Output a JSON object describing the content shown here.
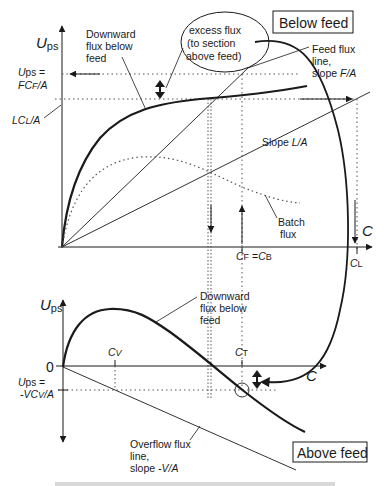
{
  "figure": {
    "type": "flux-curve-diagram",
    "top_panel": {
      "box_label": "Below feed",
      "y_axis_label_main": "U",
      "y_axis_label_sub": "ps",
      "x_axis_label": "C",
      "ups_label_line1": "U",
      "ups_label_line1_sub": "ps",
      "ups_label_line1_eq": " =",
      "ups_label_line2": "FC",
      "ups_label_line2_sub": "F",
      "ups_label_line2_tail": "/A",
      "lcl_label_main": "LC",
      "lcl_label_sub": "L",
      "lcl_label_tail": "/A",
      "downward_flux_label": [
        "Downward",
        "flux below",
        "feed"
      ],
      "excess_flux_label": [
        "excess flux",
        "(to section",
        "above feed)"
      ],
      "feed_flux_label": [
        "Feed flux",
        "line,",
        "slope "
      ],
      "feed_flux_slope": "F/A",
      "slope_l_label": "Slope ",
      "slope_l_value": "L/A",
      "batch_flux_label": [
        "Batch",
        "flux"
      ],
      "cf_label_a": "C",
      "cf_label_a_sub": "F",
      "cf_label_eq": " =",
      "cf_label_b": "C",
      "cf_label_b_sub": "B",
      "cl_label": "C",
      "cl_label_sub": "L"
    },
    "bottom_panel": {
      "box_label": "Above feed",
      "y_axis_label_main": "U",
      "y_axis_label_sub": "ps",
      "x_axis_label": "C",
      "zero_label": "0",
      "cv_label": "C",
      "cv_label_sub": "V",
      "ct_label": "C",
      "ct_label_sub": "T",
      "ups_label_line1": "U",
      "ups_label_line1_sub": "ps",
      "ups_label_line1_eq": " =",
      "ups_label_line2": "-VC",
      "ups_label_line2_sub": "V",
      "ups_label_line2_tail": "/A",
      "downward_flux_label": [
        "Downward",
        "flux below",
        "feed"
      ],
      "overflow_label": [
        "Overflow flux",
        "line,",
        "slope "
      ],
      "overflow_slope": "-V/A"
    },
    "caption_partial": "Figure — Feed flux, batch flux, and underflow flux..."
  },
  "colors": {
    "ink": "#1a1a1a",
    "dotted": "#555555",
    "background": "#ffffff"
  }
}
